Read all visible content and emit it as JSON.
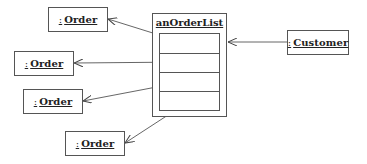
{
  "diagram": {
    "type": "UML object diagram",
    "collection": {
      "label": "anOrderList",
      "slots": 4
    },
    "objects": [
      {
        "id": "order1",
        "colon": ":",
        "name": "Order"
      },
      {
        "id": "order2",
        "colon": ":",
        "name": "Order"
      },
      {
        "id": "order3",
        "colon": ":",
        "name": "Order"
      },
      {
        "id": "order4",
        "colon": ":",
        "name": "Order"
      },
      {
        "id": "customer",
        "colon": ":",
        "name": "Customer"
      }
    ],
    "links": [
      {
        "from": "anOrderList.slot1",
        "to": "order1"
      },
      {
        "from": "anOrderList.slot2",
        "to": "order2"
      },
      {
        "from": "anOrderList.slot3",
        "to": "order3"
      },
      {
        "from": "anOrderList.slot4",
        "to": "order4"
      },
      {
        "from": "customer",
        "to": "anOrderList"
      }
    ]
  }
}
